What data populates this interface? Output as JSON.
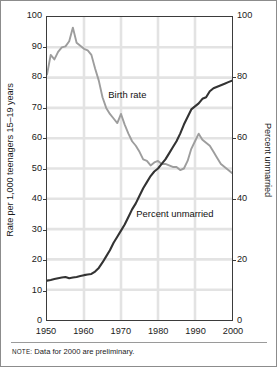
{
  "note": {
    "kicker": "NOTE:",
    "text": " Data for 2000 are preliminary."
  },
  "colors": {
    "birth_rate_line": "#9d9d9d",
    "percent_unmarried_line": "#333333",
    "frame": "#3b3b3b",
    "grid": "#e3e3e3",
    "outer_border": "#8c8c8c",
    "text": "#1a1a1a"
  },
  "annotations": {
    "birth_rate": "Birth rate",
    "percent_unmarried": "Percent unmarried"
  },
  "chart_data": {
    "type": "line",
    "title": "",
    "subtitle": "",
    "xlabel": "",
    "ylabel": "Rate per 1,000 teenagers 15–19 years",
    "ylabel_right": "Percent unmarried",
    "xlim": [
      1950,
      2000
    ],
    "ylim": [
      0,
      100
    ],
    "ylim_right": [
      0,
      100
    ],
    "xticks": [
      1950,
      1960,
      1970,
      1980,
      1990,
      2000
    ],
    "xticklabels": [
      "1950",
      "1960",
      "1970",
      "1980",
      "1990",
      "2000"
    ],
    "yticks": [
      0,
      10,
      20,
      30,
      40,
      50,
      60,
      70,
      80,
      90,
      100
    ],
    "yticklabels": [
      "0",
      "10",
      "20",
      "30",
      "40",
      "50",
      "60",
      "70",
      "80",
      "90",
      "100"
    ],
    "yticks_right": [
      0,
      20,
      40,
      60,
      80,
      100
    ],
    "yticklabels_right": [
      "0",
      "20",
      "40",
      "60",
      "80",
      "100"
    ],
    "grid": true,
    "legend": "inline-annotations",
    "x": [
      1950,
      1951,
      1952,
      1953,
      1954,
      1955,
      1956,
      1957,
      1958,
      1959,
      1960,
      1961,
      1962,
      1963,
      1964,
      1965,
      1966,
      1967,
      1968,
      1969,
      1970,
      1971,
      1972,
      1973,
      1974,
      1975,
      1976,
      1977,
      1978,
      1979,
      1980,
      1981,
      1982,
      1983,
      1984,
      1985,
      1986,
      1987,
      1988,
      1989,
      1990,
      1991,
      1992,
      1993,
      1994,
      1995,
      1996,
      1997,
      1998,
      1999,
      2000
    ],
    "series": [
      {
        "name": "Birth rate",
        "axis": "left",
        "units": "births per 1,000 teenagers aged 15–19",
        "color": "#9d9d9d",
        "values": [
          81.0,
          87.5,
          86.0,
          88.5,
          90.0,
          90.3,
          92.0,
          96.5,
          91.5,
          90.5,
          89.5,
          89.0,
          87.5,
          83.0,
          79.0,
          73.5,
          70.0,
          68.0,
          66.5,
          65.0,
          68.0,
          64.5,
          61.5,
          59.0,
          57.5,
          55.5,
          53.0,
          52.5,
          51.0,
          52.0,
          52.5,
          51.5,
          51.5,
          51.0,
          50.5,
          50.5,
          49.5,
          50.0,
          52.5,
          56.5,
          59.0,
          61.5,
          59.5,
          58.5,
          57.5,
          55.5,
          53.5,
          51.5,
          50.5,
          49.5,
          48.5
        ]
      },
      {
        "name": "Percent unmarried",
        "axis": "right",
        "units": "percent of teen births to unmarried mothers",
        "color": "#333333",
        "values": [
          13.0,
          13.2,
          13.5,
          13.8,
          14.0,
          14.2,
          13.8,
          14.0,
          14.2,
          14.5,
          14.8,
          15.0,
          15.2,
          16.0,
          17.2,
          19.0,
          21.0,
          23.0,
          25.5,
          27.5,
          29.5,
          31.5,
          34.0,
          36.5,
          38.5,
          41.0,
          43.5,
          45.5,
          47.5,
          49.0,
          50.0,
          51.5,
          53.0,
          55.0,
          57.0,
          59.0,
          61.5,
          64.5,
          67.0,
          69.5,
          70.5,
          71.5,
          73.0,
          73.5,
          75.5,
          76.5,
          77.0,
          77.5,
          78.0,
          78.5,
          79.0
        ]
      }
    ]
  }
}
